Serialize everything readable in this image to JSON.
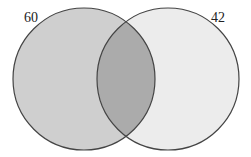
{
  "diagram": {
    "type": "venn",
    "sets": [
      {
        "label": "60",
        "fill": "#cfcfcf"
      },
      {
        "label": "42",
        "fill": "#ececec"
      }
    ],
    "intersection_fill": "#ababab",
    "stroke": "#444444"
  }
}
